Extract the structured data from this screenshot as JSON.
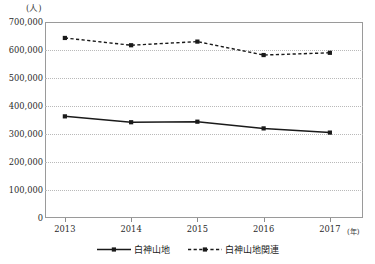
{
  "chart_data": {
    "type": "line",
    "title": "",
    "xlabel": "年",
    "ylabel": "人",
    "x_unit_label": "(年)",
    "y_unit_label": "(人)",
    "categories": [
      "2013",
      "2014",
      "2015",
      "2016",
      "2017"
    ],
    "x": [
      2013,
      2014,
      2015,
      2016,
      2017
    ],
    "xlim": [
      2012.7,
      2017.5
    ],
    "ylim": [
      0,
      700000
    ],
    "y_ticks": [
      0,
      100000,
      200000,
      300000,
      400000,
      500000,
      600000,
      700000
    ],
    "y_tick_labels": [
      "0",
      "100,000",
      "200,000",
      "300,000",
      "400,000",
      "500,000",
      "600,000",
      "700,000"
    ],
    "grid": true,
    "grid_style": "dotted",
    "legend_position": "bottom",
    "series": [
      {
        "name": "白神山地",
        "style": "solid",
        "marker": "square",
        "color": "#1a1a1a",
        "values": [
          363000,
          342000,
          344000,
          320000,
          305000
        ]
      },
      {
        "name": "白神山地関連",
        "style": "dashed",
        "marker": "square",
        "color": "#1a1a1a",
        "values": [
          643000,
          617000,
          630000,
          582000,
          590000
        ]
      }
    ]
  },
  "legend": {
    "items": [
      {
        "label": "白神山地",
        "style": "solid"
      },
      {
        "label": "白神山地関連",
        "style": "dashed"
      }
    ]
  },
  "colors": {
    "line": "#1a1a1a",
    "grid": "#b9b9b9",
    "frame": "#9a9a9a",
    "text": "#2b2b2b"
  }
}
